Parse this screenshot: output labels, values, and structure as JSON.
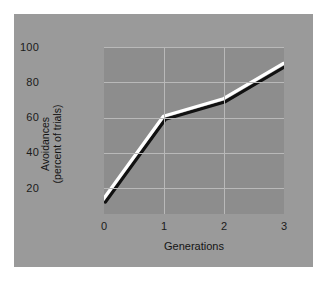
{
  "chart_data": {
    "type": "line",
    "title": "",
    "xlabel": "Generations",
    "ylabel_line1": "Avoidances",
    "ylabel_line2": "(percent of trials)",
    "x": [
      0,
      1,
      2,
      3
    ],
    "values": [
      13,
      60,
      70,
      90
    ],
    "series": [
      {
        "name": "Avoidances",
        "values": [
          13,
          60,
          70,
          90
        ]
      }
    ],
    "xticks": [
      "0",
      "1",
      "2",
      "3"
    ],
    "yticks": [
      "20",
      "40",
      "60",
      "80",
      "100"
    ],
    "xlim": [
      0,
      3
    ],
    "ylim": [
      0,
      107
    ],
    "grid": true,
    "legend": "none",
    "colors": {
      "figure_background": "#9a9a9a",
      "plot_background": "#8d8d8d",
      "gridline": "#b9b9b9",
      "line_highlight": "#ffffff",
      "line_shadow": "#111111",
      "text": "#141414",
      "page_background": "#ffffff"
    }
  },
  "axes": {
    "y_axis_title_line1": "Avoidances",
    "y_axis_title_line2": "(percent of trials)",
    "x_axis_title": "Generations",
    "y_tick_labels": [
      "100",
      "80",
      "60",
      "40",
      "20"
    ],
    "x_tick_labels": [
      "0",
      "1",
      "2",
      "3"
    ]
  }
}
